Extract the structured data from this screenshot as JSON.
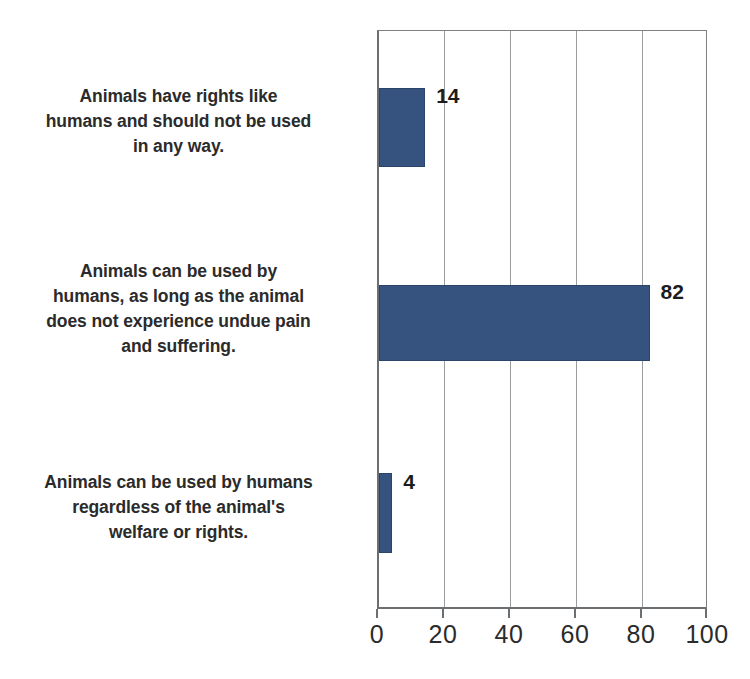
{
  "chart_data": {
    "type": "bar",
    "orientation": "horizontal",
    "title": "",
    "subtitle": "",
    "xlabel": "",
    "ylabel": "",
    "categories": [
      "Animals have rights like\nhumans and should not be used\nin any way.",
      "Animals can be used by\nhumans, as long as the animal\ndoes not experience undue pain\nand suffering.",
      "Animals can be used by humans\nregardless of the animal's\nwelfare or rights."
    ],
    "values": [
      14,
      82,
      4
    ],
    "value_labels": [
      "14",
      "82",
      "4"
    ],
    "xlim": [
      0,
      100
    ],
    "xticks": [
      0,
      20,
      40,
      60,
      80,
      100
    ],
    "xtick_labels": [
      "0",
      "20",
      "40",
      "60",
      "80",
      "100"
    ],
    "grid": "vertical",
    "legend": "none",
    "colors": {
      "bar_fill": "#35537e",
      "bar_edge": "#2b4469",
      "gridline": "#9a9ea0",
      "axis": "#6b6f71",
      "text": "#2b2b2b",
      "background": "#ffffff"
    }
  }
}
